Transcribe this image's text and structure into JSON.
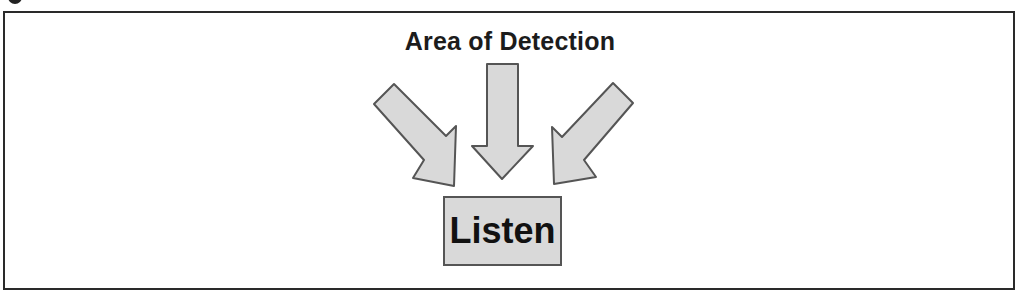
{
  "diagram": {
    "title": "Area of Detection",
    "target_box": {
      "label": "Listen"
    },
    "arrows": [
      {
        "id": "left",
        "direction": "down-right"
      },
      {
        "id": "center",
        "direction": "down"
      },
      {
        "id": "right",
        "direction": "down-left"
      }
    ],
    "colors": {
      "arrow_fill": "#d9d9d9",
      "arrow_stroke": "#555555",
      "box_fill": "#d9d9d9",
      "frame": "#2a2a2a",
      "text": "#1c1c1c"
    }
  }
}
